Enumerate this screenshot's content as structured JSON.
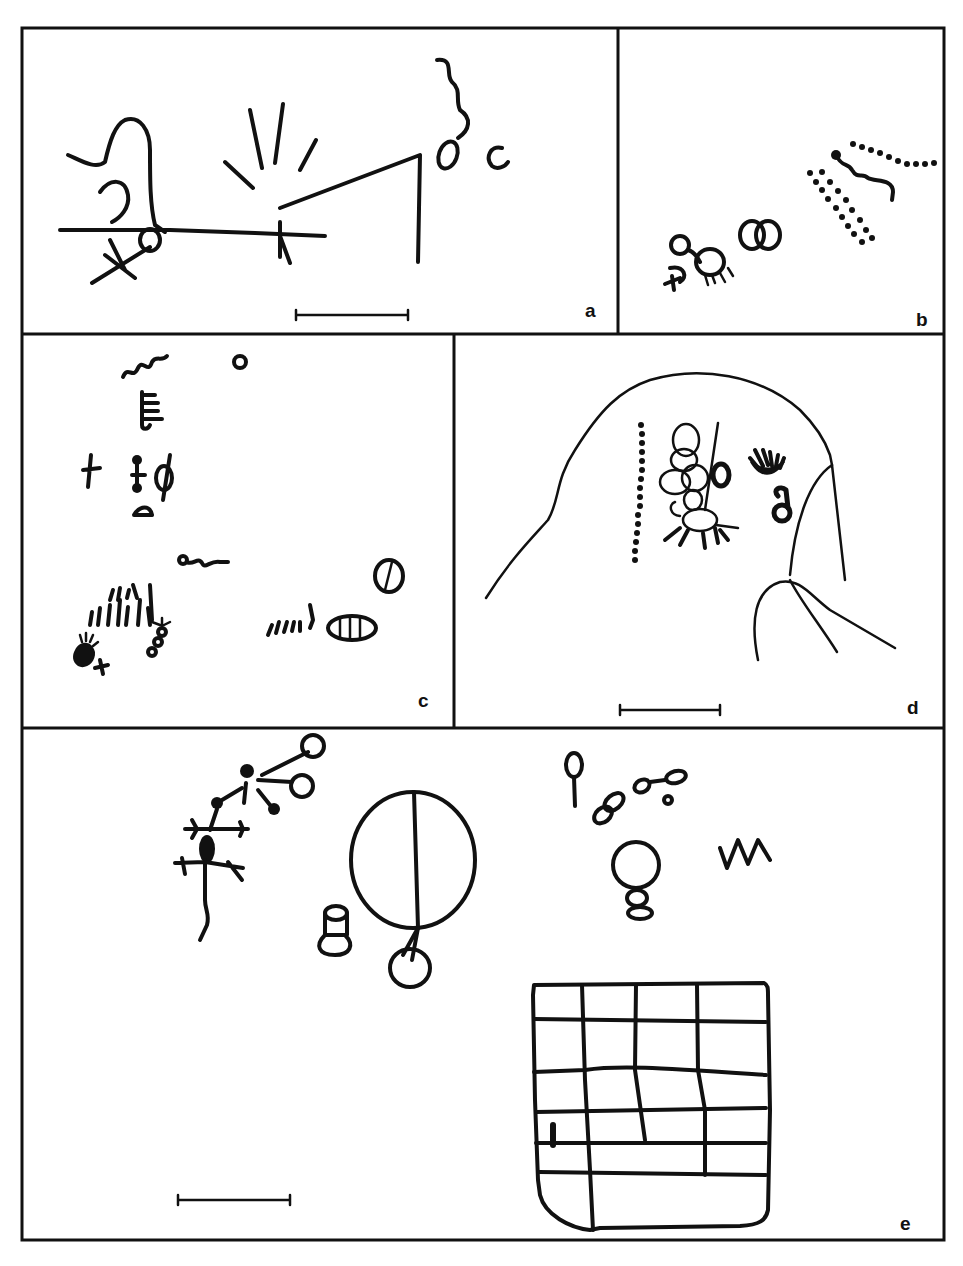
{
  "figure": {
    "panels": [
      {
        "id": "a",
        "label": "a",
        "scale_bar": true
      },
      {
        "id": "b",
        "label": "b",
        "scale_bar": false
      },
      {
        "id": "c",
        "label": "c",
        "scale_bar": false
      },
      {
        "id": "d",
        "label": "d",
        "scale_bar": true
      },
      {
        "id": "e",
        "label": "e",
        "scale_bar": true
      }
    ]
  },
  "colors": {
    "ink": "#111111",
    "paper": "#ffffff"
  }
}
